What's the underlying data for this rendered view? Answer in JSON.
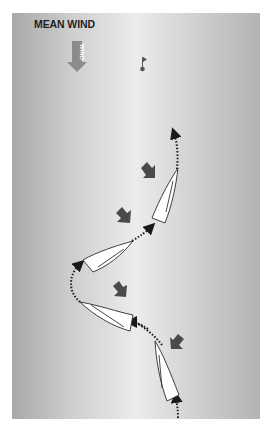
{
  "diagram": {
    "title": "MEAN WIND",
    "wind_arrow_label": "WIND",
    "colors": {
      "background_edge": "#a9a9a9",
      "background_center": "#ececec",
      "wind_arrow": "#8c8c8c",
      "gust_arrow": "#4a4a4a",
      "boat_fill": "#ffffff",
      "boat_outline": "#2a2a2a",
      "track": "#1a1a1a"
    },
    "elements": {
      "mark": {
        "label": "mark-flag",
        "x": 143,
        "y": 67
      },
      "boats": [
        {
          "id": 1,
          "position": "bottom",
          "heading": "upwind-port-tack"
        },
        {
          "id": 2,
          "position": "lower-middle",
          "heading": "bearing-away"
        },
        {
          "id": 3,
          "position": "upper-middle",
          "heading": "tacking"
        },
        {
          "id": 4,
          "position": "top",
          "heading": "upwind"
        }
      ],
      "gust_arrows": 4,
      "track_style": "dotted-with-arrowheads"
    }
  }
}
